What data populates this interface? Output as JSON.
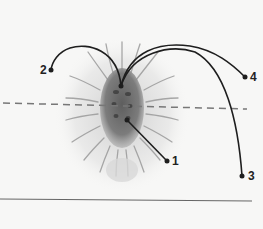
{
  "diagram": {
    "labels": [
      {
        "id": "1",
        "text": "1",
        "dot": [
          167,
          161
        ],
        "text_pos": [
          172,
          155
        ],
        "origin": [
          127,
          120
        ]
      },
      {
        "id": "2",
        "text": "2",
        "dot": [
          51,
          70
        ],
        "text_pos": [
          40,
          64
        ],
        "origin": [
          121,
          86
        ]
      },
      {
        "id": "3",
        "text": "3",
        "dot": [
          242,
          176
        ],
        "text_pos": [
          248,
          170
        ],
        "origin": [
          121,
          86
        ]
      },
      {
        "id": "4",
        "text": "4",
        "dot": [
          245,
          77
        ],
        "text_pos": [
          250,
          71
        ],
        "origin": [
          121,
          86
        ]
      }
    ],
    "dashed_axis": {
      "from": [
        3,
        103
      ],
      "to": [
        247,
        109
      ]
    },
    "bottom_rule": {
      "from": [
        0,
        199
      ],
      "to": [
        252,
        201
      ]
    },
    "colors": {
      "line": "#1e1e1e",
      "body": "#6e6e6e",
      "setae": "#9a9a9a",
      "dash": "#777777",
      "background": "#f7f7f6"
    }
  }
}
